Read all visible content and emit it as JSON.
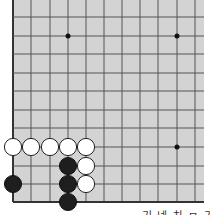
{
  "diagram": {
    "type": "go-board-partial",
    "board": {
      "background": "#d3d3d3",
      "line_color": "#555555",
      "border_color": "#333333",
      "left_x": 13,
      "right_x": 204,
      "top_y": 0,
      "bottom_y": 202,
      "vertical_lines": [
        13,
        31,
        50,
        68,
        86,
        104,
        122,
        140,
        158,
        177,
        195
      ],
      "horizontal_lines": [
        17,
        36,
        54,
        73,
        91,
        110,
        128,
        147,
        166,
        184,
        202
      ],
      "star_points": [
        {
          "col": 3,
          "row": 1
        },
        {
          "col": 9,
          "row": 1
        },
        {
          "col": 9,
          "row": 7
        }
      ]
    },
    "stones": [
      {
        "color": "white",
        "col": 0,
        "row": 7
      },
      {
        "color": "white",
        "col": 1,
        "row": 7
      },
      {
        "color": "white",
        "col": 2,
        "row": 7
      },
      {
        "color": "white",
        "col": 3,
        "row": 7
      },
      {
        "color": "white",
        "col": 4,
        "row": 7
      },
      {
        "color": "black",
        "col": 3,
        "row": 8
      },
      {
        "color": "white",
        "col": 4,
        "row": 8
      },
      {
        "color": "black",
        "col": 0,
        "row": 9
      },
      {
        "color": "black",
        "col": 3,
        "row": 9
      },
      {
        "color": "white",
        "col": 4,
        "row": 9
      },
      {
        "color": "black",
        "col": 3,
        "row": 10
      }
    ],
    "stone_colors": {
      "black": "#1e1e1e",
      "white": "#ffffff",
      "white_outline": "#222222"
    },
    "caption": "기 넷 차 ㅁ 기 두 서 새"
  }
}
